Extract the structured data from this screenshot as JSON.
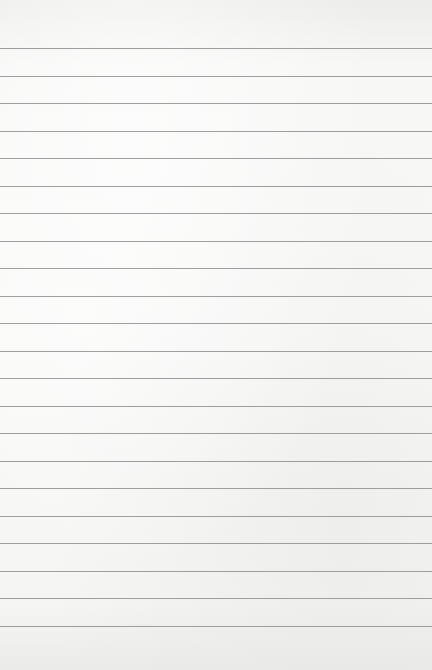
{
  "page": {
    "type": "lined-paper",
    "background_color": "#f7f7f6",
    "rule_color": "#8e8e8e",
    "rule_count": 22,
    "first_rule_y": 48,
    "rule_spacing": 27.5
  }
}
